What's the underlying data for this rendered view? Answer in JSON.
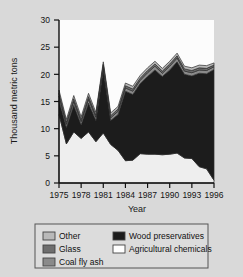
{
  "chart_data": {
    "type": "area",
    "stacked": true,
    "title": "",
    "xlabel": "Year",
    "ylabel": "Thousand metric tons",
    "x": [
      1975,
      1976,
      1977,
      1978,
      1979,
      1980,
      1981,
      1982,
      1983,
      1984,
      1985,
      1986,
      1987,
      1988,
      1989,
      1990,
      1991,
      1992,
      1993,
      1994,
      1995,
      1996
    ],
    "xtick_labels": [
      "1975",
      "1978",
      "1981",
      "1984",
      "1987",
      "1990",
      "1993",
      "1996"
    ],
    "xticks": [
      1975,
      1978,
      1981,
      1984,
      1987,
      1990,
      1993,
      1996
    ],
    "xlim": [
      1975,
      1996
    ],
    "ytick_labels": [
      "0",
      "5",
      "10",
      "15",
      "20",
      "25",
      "30"
    ],
    "yticks": [
      0,
      5,
      10,
      15,
      20,
      25,
      30
    ],
    "ylim": [
      0,
      30
    ],
    "grid": false,
    "legend_position": "below",
    "series": [
      {
        "name": "Agricultural chemicals",
        "color": "#eeeeee",
        "values": [
          12.6,
          7.2,
          9.4,
          8.2,
          9.4,
          7.6,
          9.2,
          7.1,
          6.0,
          4.1,
          4.2,
          5.4,
          5.3,
          5.3,
          5.2,
          5.3,
          5.5,
          4.6,
          4.5,
          3.0,
          2.6,
          0.5
        ]
      },
      {
        "name": "Wood preservatives",
        "color": "#1c1c1c",
        "values": [
          2.6,
          3.0,
          4.9,
          2.5,
          5.3,
          3.9,
          11.6,
          4.4,
          6.6,
          12.8,
          12.1,
          12.9,
          14.3,
          15.5,
          14.4,
          15.5,
          16.8,
          15.4,
          15.2,
          17.2,
          17.5,
          20.4
        ]
      },
      {
        "name": "Coal fly ash",
        "color": "#8a8a8a",
        "values": [
          0.8,
          0.6,
          0.7,
          0.6,
          0.7,
          0.6,
          0.6,
          0.5,
          0.6,
          0.6,
          0.6,
          0.6,
          0.7,
          0.7,
          0.6,
          0.7,
          0.7,
          0.6,
          0.6,
          0.6,
          0.6,
          0.5
        ]
      },
      {
        "name": "Glass",
        "color": "#6e6e6e",
        "values": [
          0.5,
          0.4,
          0.5,
          0.4,
          0.5,
          0.4,
          0.4,
          0.4,
          0.4,
          0.4,
          0.4,
          0.4,
          0.4,
          0.4,
          0.4,
          0.4,
          0.4,
          0.4,
          0.4,
          0.4,
          0.4,
          0.3
        ]
      },
      {
        "name": "Other",
        "color": "#b9b9b9",
        "values": [
          0.6,
          0.5,
          0.6,
          0.5,
          0.6,
          0.5,
          0.5,
          0.5,
          0.5,
          0.5,
          0.5,
          0.5,
          0.5,
          0.5,
          0.5,
          0.5,
          0.5,
          0.5,
          0.5,
          0.5,
          0.5,
          0.4
        ]
      }
    ],
    "totals": [
      17.1,
      11.7,
      16.1,
      12.2,
      16.5,
      13.0,
      22.3,
      12.9,
      14.1,
      18.4,
      17.8,
      19.8,
      21.2,
      22.4,
      21.1,
      22.4,
      23.9,
      21.5,
      21.2,
      21.7,
      21.6,
      22.1
    ],
    "legend": [
      {
        "label": "Other",
        "color": "#b9b9b9",
        "column": "left"
      },
      {
        "label": "Glass",
        "color": "#6e6e6e",
        "column": "left"
      },
      {
        "label": "Coal fly ash",
        "color": "#8a8a8a",
        "column": "left"
      },
      {
        "label": "Wood preservatives",
        "color": "#1c1c1c",
        "column": "right"
      },
      {
        "label": "Agricultural chemicals",
        "color": "#ffffff",
        "column": "right"
      }
    ]
  },
  "colors": {
    "figure_background": "#d9d9d9",
    "plot_background": "#fcfcfc",
    "axis": "#111111",
    "text": "#111111",
    "legend_border": "#555555",
    "legend_background": "#dcdcdc"
  }
}
